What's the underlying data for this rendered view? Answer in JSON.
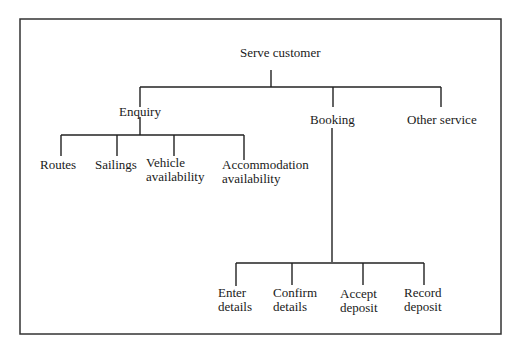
{
  "diagram": {
    "type": "hierarchy",
    "root": {
      "label": "Serve customer",
      "children": [
        {
          "label": "Enquiry",
          "children": [
            {
              "label": "Routes"
            },
            {
              "label": "Sailings"
            },
            {
              "label": "Vehicle availability",
              "lines": [
                "Vehicle",
                "availability"
              ]
            },
            {
              "label": "Accommodation availability",
              "lines": [
                "Accommodation",
                "availability"
              ]
            }
          ]
        },
        {
          "label": "Booking",
          "children": [
            {
              "label": "Enter details",
              "lines": [
                "Enter",
                "details"
              ]
            },
            {
              "label": "Confirm details",
              "lines": [
                "Confirm",
                "details"
              ]
            },
            {
              "label": "Accept deposit",
              "lines": [
                "Accept",
                "deposit"
              ]
            },
            {
              "label": "Record deposit",
              "lines": [
                "Record",
                "deposit"
              ]
            }
          ]
        },
        {
          "label": "Other service"
        }
      ]
    }
  },
  "labels": {
    "root": "Serve customer",
    "enquiry": "Enquiry",
    "booking": "Booking",
    "other": "Other service",
    "routes": "Routes",
    "sailings": "Sailings",
    "vehicle_1": "Vehicle",
    "vehicle_2": "availability",
    "accom_1": "Accommodation",
    "accom_2": "availability",
    "enter_1": "Enter",
    "enter_2": "details",
    "confirm_1": "Confirm",
    "confirm_2": "details",
    "accept_1": "Accept",
    "accept_2": "deposit",
    "record_1": "Record",
    "record_2": "deposit"
  },
  "colors": {
    "line": "#222222",
    "frame": "#333333",
    "text": "#1a1a1a",
    "background": "#ffffff"
  }
}
